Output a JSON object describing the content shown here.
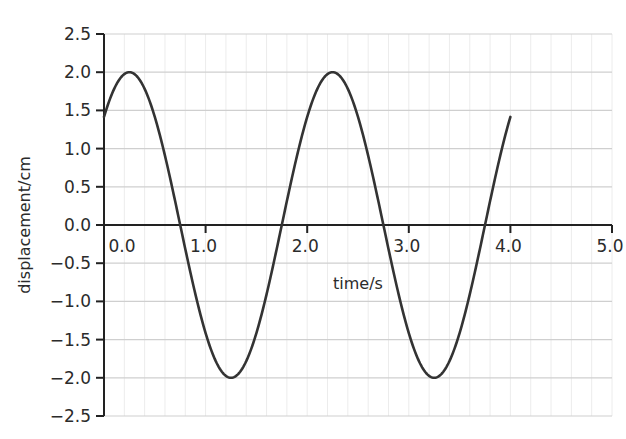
{
  "chart_data": {
    "type": "line",
    "title": "",
    "xlabel": "time/s",
    "ylabel": "displacement/cm",
    "xlim": [
      0,
      5.0
    ],
    "ylim": [
      -2.5,
      2.5
    ],
    "x_ticks": [
      "0.0",
      "1.0",
      "2.0",
      "3.0",
      "4.0",
      "5.0"
    ],
    "y_ticks": [
      "2.5",
      "2.0",
      "1.5",
      "1.0",
      "0.5",
      "0.0",
      "−0.5",
      "−1.0",
      "−1.5",
      "−2.0",
      "−2.5"
    ],
    "grid": true,
    "legend": null,
    "series": [
      {
        "name": "displacement",
        "equation_hint": "2 sin(pi t + pi/4)",
        "amplitude_cm": 2.0,
        "period_s": 2.0,
        "x": [
          0.0,
          0.25,
          0.5,
          0.75,
          1.0,
          1.25,
          1.5,
          1.75,
          2.0,
          2.25,
          2.5,
          2.75,
          3.0,
          3.25,
          3.5,
          3.75,
          4.0
        ],
        "values": [
          1.41,
          2.0,
          1.41,
          0.0,
          -1.41,
          -2.0,
          -1.41,
          0.0,
          1.41,
          2.0,
          1.41,
          0.0,
          -1.41,
          -2.0,
          -1.41,
          0.0,
          1.41
        ]
      }
    ],
    "colors": {
      "line": "#333333",
      "axis": "#222222",
      "major_grid": "#cfcfcf",
      "minor_grid": "#ececec"
    }
  }
}
